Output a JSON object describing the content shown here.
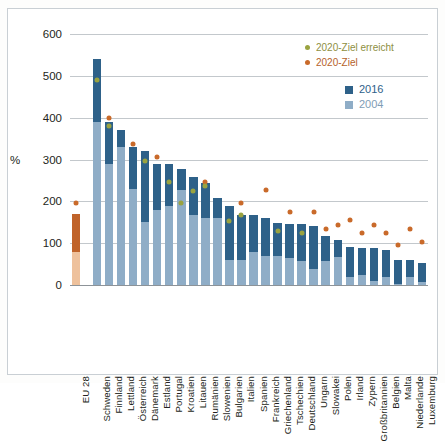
{
  "chart_data": {
    "type": "bar",
    "title": "",
    "xlabel": "",
    "ylabel": "%",
    "ylim": [
      0,
      600
    ],
    "yticks": [
      0,
      100,
      200,
      300,
      400,
      500,
      600
    ],
    "grid": true,
    "stacked": false,
    "legend_position": "top-right",
    "categories": [
      "EU 28",
      "Schweden",
      "Finnland",
      "Lettland",
      "Österreich",
      "Dänemark",
      "Estland",
      "Portugal",
      "Kroatien",
      "Litauen",
      "Rumänien",
      "Slowenien",
      "Bulgarien",
      "Italien",
      "Spanien",
      "Frankreich",
      "Griechenland",
      "Tschechien",
      "Deutschland",
      "Ungarn",
      "Slowakei",
      "Polen",
      "Irland",
      "Zypern",
      "Großbritannien",
      "Belgien",
      "Malta",
      "Niederlande",
      "Luxemburg"
    ],
    "series": [
      {
        "name": "2016",
        "color": "#2e6189",
        "values": [
          170,
          540,
          390,
          370,
          330,
          320,
          290,
          290,
          278,
          258,
          243,
          208,
          190,
          168,
          168,
          160,
          148,
          147,
          147,
          140,
          117,
          108,
          90,
          88,
          88,
          83,
          60,
          60,
          52
        ]
      },
      {
        "name": "2004",
        "color": "#8fadc7",
        "values": [
          80,
          390,
          290,
          330,
          230,
          150,
          180,
          190,
          228,
          168,
          160,
          160,
          60,
          60,
          78,
          70,
          70,
          65,
          58,
          38,
          58,
          68,
          18,
          25,
          10,
          18,
          3,
          18,
          8
        ]
      }
    ],
    "markers": [
      {
        "name": "2020-Ziel",
        "color": "#c96a2a",
        "values": [
          197,
          null,
          400,
          null,
          337,
          null,
          307,
          null,
          null,
          null,
          246,
          null,
          null,
          196,
          null,
          226,
          null,
          175,
          null,
          175,
          133,
          144,
          155,
          124,
          144,
          124,
          95,
          133,
          103
        ]
      },
      {
        "name": "2020-Ziel erreicht",
        "color": "#9aa340",
        "values": [
          null,
          490,
          380,
          null,
          null,
          297,
          null,
          246,
          197,
          225,
          237,
          null,
          154,
          167,
          null,
          null,
          129,
          null,
          124,
          null,
          null,
          null,
          null,
          null,
          null,
          null,
          null,
          null,
          null
        ]
      }
    ]
  },
  "legend": {
    "marker_items": [
      {
        "label": "2020-Ziel erreicht",
        "color": "#9aa340"
      },
      {
        "label": "2020-Ziel",
        "color": "#c96a2a"
      }
    ],
    "bar_items": [
      {
        "label": "2016",
        "color": "#2e6189"
      },
      {
        "label": "2004",
        "color": "#8fadc7"
      }
    ]
  },
  "axis": {
    "y_unit": "%",
    "tick_labels": [
      "600",
      "500",
      "400",
      "300",
      "200",
      "100",
      "0"
    ]
  }
}
